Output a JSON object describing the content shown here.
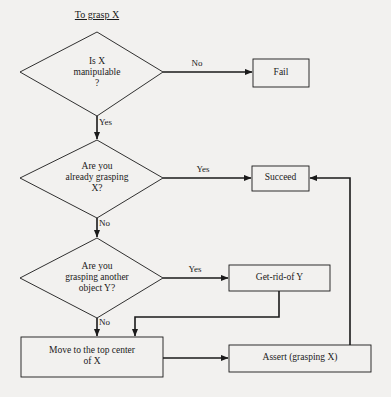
{
  "diagram": {
    "title": "To grasp X",
    "type": "flowchart",
    "background_color": "#f2f1ef",
    "line_color": "#1a1a1a",
    "text_color": "#1a1a1a",
    "nodes": [
      {
        "id": "d1",
        "shape": "diamond",
        "label": "Is X\nmanipulable\n?"
      },
      {
        "id": "fail",
        "shape": "rectangle",
        "label": "Fail"
      },
      {
        "id": "d2",
        "shape": "diamond",
        "label": "Are you\nalready grasping\nX?"
      },
      {
        "id": "succeed",
        "shape": "rectangle",
        "label": "Succeed"
      },
      {
        "id": "d3",
        "shape": "diamond",
        "label": "Are you\ngrasping another\nobject Y?"
      },
      {
        "id": "getrid",
        "shape": "rectangle",
        "label": "Get-rid-of Y"
      },
      {
        "id": "move",
        "shape": "rectangle",
        "label": "Move to the top center\nof X"
      },
      {
        "id": "assert",
        "shape": "rectangle",
        "label": "Assert (grasping X)"
      }
    ],
    "edge_labels": {
      "d1_no": "No",
      "d1_yes": "Yes",
      "d2_yes": "Yes",
      "d2_no": "No",
      "d3_yes": "Yes",
      "d3_no": "No"
    }
  }
}
